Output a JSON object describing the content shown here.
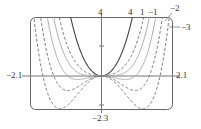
{
  "chart_data": {
    "type": "line",
    "title": "",
    "xlabel": "",
    "ylabel": "",
    "xlim": [
      -2.1,
      2.1
    ],
    "ylim": [
      -2.3,
      4
    ],
    "grid": false,
    "legend": "inline labels at top-right of curves",
    "function_family": "y = x^4 + c x^2",
    "series": [
      {
        "name": "4",
        "c": 4,
        "style": "solid"
      },
      {
        "name": "1",
        "c": 1,
        "style": "dashed"
      },
      {
        "name": "0",
        "c": 0,
        "style": "solid-light"
      },
      {
        "name": "-1",
        "c": -1,
        "style": "solid-light"
      },
      {
        "name": "-2",
        "c": -2,
        "style": "dashed"
      },
      {
        "name": "-3",
        "c": -3,
        "style": "dashed"
      }
    ],
    "tick_labels": {
      "x_min": "−2.1",
      "x_max": "2.1",
      "y_max": "4",
      "y_min": "−2.3"
    },
    "curve_labels": [
      "4",
      "1",
      "−1",
      "−2",
      "−3"
    ]
  },
  "axes": {
    "x_min_label": "−2.1",
    "x_max_label": "2.1",
    "y_max_label": "4",
    "y_min_label": "−2.3"
  },
  "curve_labels": {
    "c4": "4",
    "c1": "1",
    "cm1": "−1",
    "cm2": "−2",
    "cm3": "−3"
  }
}
